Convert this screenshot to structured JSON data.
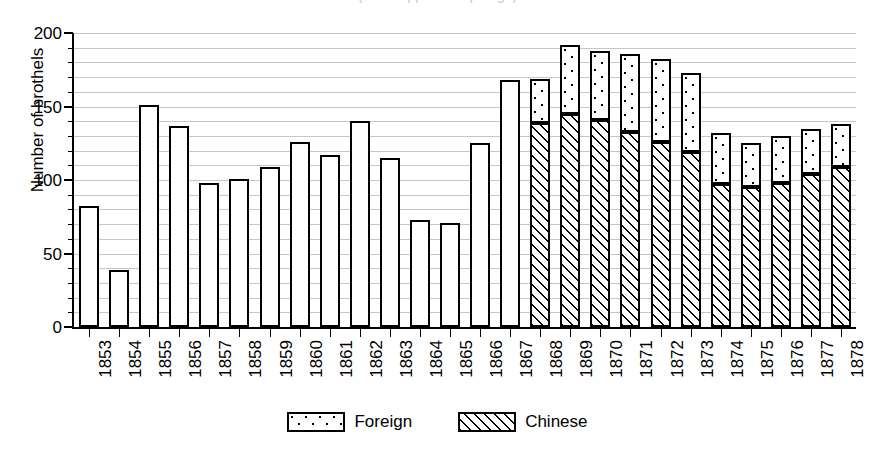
{
  "figure": {
    "title_partial": "(title cropped at top edge)",
    "background_color": "#ffffff",
    "line_color": "#000000",
    "grid_color": "#c6c6c6"
  },
  "chart_data": {
    "type": "bar",
    "stacked": true,
    "title": "",
    "xlabel": "",
    "ylabel": "Number of brothels",
    "ylim": [
      0,
      200
    ],
    "yticks": [
      0,
      50,
      100,
      150,
      200
    ],
    "ytick_labels": [
      "0",
      "50",
      "100",
      "150",
      "200"
    ],
    "grid": true,
    "grid_interval": 10,
    "legend_position": "bottom-center",
    "categories": [
      "1853",
      "1854",
      "1855",
      "1856",
      "1857",
      "1858",
      "1859",
      "1860",
      "1861",
      "1862",
      "1863",
      "1864",
      "1865",
      "1866",
      "1867",
      "1868",
      "1869",
      "1870",
      "1871",
      "1872",
      "1873",
      "1874",
      "1875",
      "1876",
      "1877",
      "1878"
    ],
    "series": [
      {
        "name": "Chinese",
        "pattern": "diagonal-hatch",
        "values": [
          null,
          null,
          null,
          null,
          null,
          null,
          null,
          null,
          null,
          null,
          null,
          null,
          null,
          null,
          null,
          139,
          145,
          141,
          133,
          126,
          119,
          97,
          95,
          98,
          104,
          109
        ]
      },
      {
        "name": "Foreign",
        "pattern": "dots",
        "values": [
          null,
          null,
          null,
          null,
          null,
          null,
          null,
          null,
          null,
          null,
          null,
          null,
          null,
          null,
          null,
          30,
          47,
          47,
          53,
          56,
          54,
          35,
          30,
          32,
          31,
          29
        ]
      }
    ],
    "totals": [
      82,
      39,
      151,
      137,
      98,
      101,
      109,
      126,
      117,
      140,
      115,
      73,
      71,
      125,
      168,
      169,
      192,
      188,
      186,
      182,
      173,
      132,
      125,
      130,
      135,
      138
    ],
    "unsplit_note": "Bars for 1853-1867 are shown as a single unfilled (white) bar with no Foreign/Chinese breakdown."
  },
  "legend": {
    "entries": [
      {
        "label": "Foreign",
        "pattern": "dots"
      },
      {
        "label": "Chinese",
        "pattern": "diagonal-hatch"
      }
    ]
  }
}
